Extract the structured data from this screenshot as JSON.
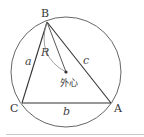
{
  "diagram": {
    "type": "circumscribed-triangle",
    "vertices": {
      "B": {
        "label": "B",
        "x": 47,
        "y": 22
      },
      "C": {
        "label": "C",
        "x": 22,
        "y": 103
      },
      "A": {
        "label": "A",
        "x": 111,
        "y": 103
      }
    },
    "circumcenter": {
      "label": "外心",
      "x": 66,
      "y": 72
    },
    "circle": {
      "cx": 66,
      "cy": 72,
      "r": 55
    },
    "sides": {
      "a": {
        "label": "a",
        "between": [
          "B",
          "C"
        ]
      },
      "b": {
        "label": "b",
        "between": [
          "C",
          "A"
        ]
      },
      "c": {
        "label": "c",
        "between": [
          "B",
          "A"
        ]
      }
    },
    "radius_label": "R",
    "colors": {
      "stroke": "#444444",
      "arc": "#777777",
      "point": "#333333"
    }
  }
}
